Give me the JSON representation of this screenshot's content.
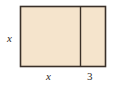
{
  "figure": {
    "type": "geometry-diagram",
    "shape": "rectangle-divided-into-two-parts",
    "canvas": {
      "width": 119,
      "height": 90,
      "background": "#ffffff"
    },
    "rectangle": {
      "x": 20.5,
      "y": 6.5,
      "width": 85,
      "height": 60,
      "fill_color": "#f5e4cc",
      "stroke_color": "#3a3028",
      "stroke_width": 1.6
    },
    "divider": {
      "orientation": "vertical",
      "x": 80.5,
      "y_top": 6.5,
      "y_bottom": 66.5,
      "stroke_color": "#3a3028",
      "stroke_width": 1.4
    },
    "labels": {
      "height": "x",
      "width_left": "x",
      "width_right": "3"
    }
  },
  "chart_data": {
    "type": "diagram",
    "title": "",
    "shape": "rectangle",
    "segments": [
      {
        "name": "left-section",
        "dimension_label": "x",
        "orientation": "horizontal"
      },
      {
        "name": "right-section",
        "dimension_label": "3",
        "orientation": "horizontal"
      }
    ],
    "side_labels": [
      {
        "side": "left",
        "label": "x"
      },
      {
        "side": "bottom-left-section",
        "label": "x"
      },
      {
        "side": "bottom-right-section",
        "label": "3"
      }
    ]
  }
}
